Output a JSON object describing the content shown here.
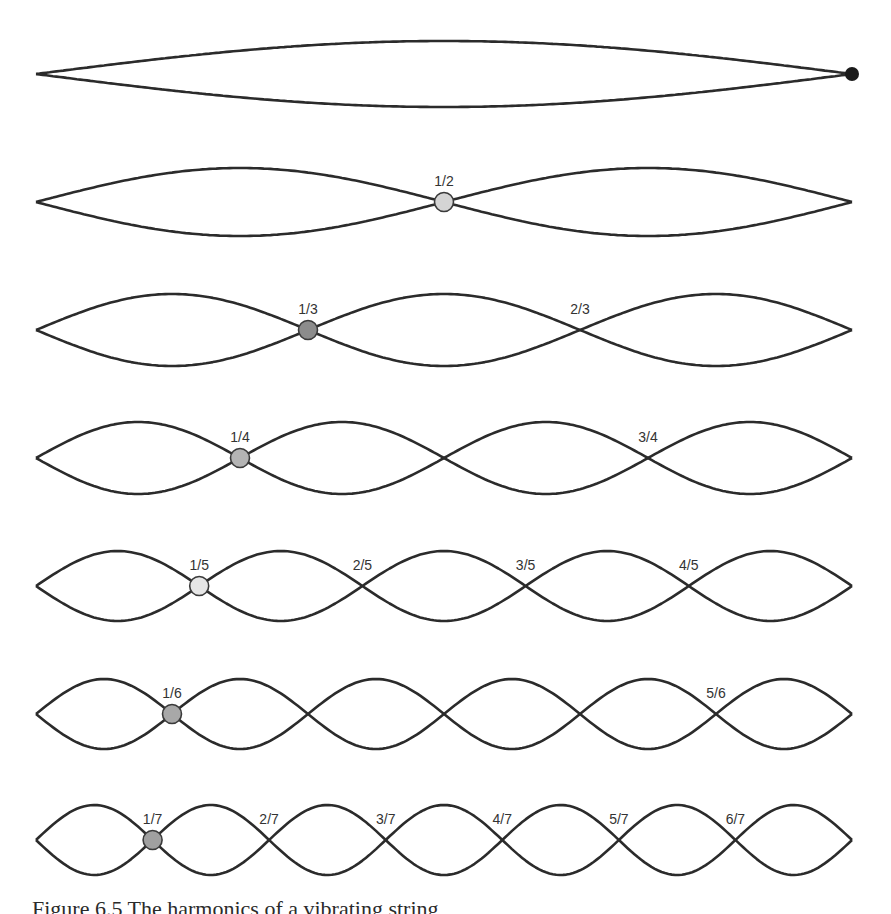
{
  "figure": {
    "x_start": 36,
    "x_end": 852,
    "harmonics": [
      {
        "n": 1,
        "y": 74,
        "amp": 33,
        "labels": [],
        "highlight": null,
        "end_dot": {
          "fill": "#1a1a1a"
        }
      },
      {
        "n": 2,
        "y": 202,
        "amp": 34,
        "labels": [
          "1/2"
        ],
        "highlight": {
          "index": 1,
          "fill": "#d4d4d4"
        }
      },
      {
        "n": 3,
        "y": 330,
        "amp": 36,
        "labels": [
          "1/3",
          "2/3"
        ],
        "highlight": {
          "index": 1,
          "fill": "#8c8c8c"
        }
      },
      {
        "n": 4,
        "y": 458,
        "amp": 36,
        "labels": [
          "1/4",
          "",
          "3/4"
        ],
        "highlight": {
          "index": 1,
          "fill": "#b4b4b4"
        }
      },
      {
        "n": 5,
        "y": 586,
        "amp": 35,
        "labels": [
          "1/5",
          "2/5",
          "3/5",
          "4/5"
        ],
        "highlight": {
          "index": 1,
          "fill": "#e6e6e6"
        }
      },
      {
        "n": 6,
        "y": 714,
        "amp": 35,
        "labels": [
          "1/6",
          "",
          "",
          "",
          "5/6"
        ],
        "highlight": {
          "index": 1,
          "fill": "#a8a8a8"
        }
      },
      {
        "n": 7,
        "y": 840,
        "amp": 35,
        "labels": [
          "1/7",
          "2/7",
          "3/7",
          "4/7",
          "5/7",
          "6/7"
        ],
        "highlight": {
          "index": 1,
          "fill": "#a0a0a0"
        }
      }
    ]
  },
  "caption": "Figure 6.5 The harmonics of a vibrating string"
}
